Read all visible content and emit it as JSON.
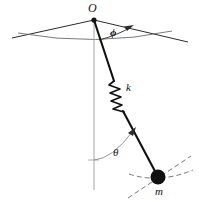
{
  "figure": {
    "type": "spherical-pendulum-with-spring-diagram",
    "background_color": "#ffffff",
    "ink_color": "#111111",
    "guide_color": "#9a9a9a",
    "labels": {
      "pivot": "O",
      "azimuth_angle": "ϕ",
      "spring_constant": "k",
      "polar_angle": "θ",
      "mass": "m"
    },
    "geometry": {
      "pivot_point": [
        94,
        20
      ],
      "mass_point": [
        158,
        177
      ],
      "vertical_axis_end": [
        94,
        190
      ],
      "ceiling_left_end": [
        12,
        38
      ],
      "ceiling_right_end": [
        188,
        42
      ],
      "spring_start": [
        113,
        82
      ],
      "spring_end": [
        124,
        110
      ],
      "spring_coils": 6,
      "mass_radius": 7,
      "phi_arc_arrow_at": [
        132,
        26
      ],
      "theta_arc_arrow_at": [
        134,
        130
      ]
    },
    "elements": [
      "pivot-point",
      "ceiling-line-left",
      "ceiling-line-right",
      "ceiling-arc",
      "phi-angle-arc",
      "vertical-reference-line",
      "pendulum-rod",
      "spring-coil",
      "theta-angle-arc",
      "point-mass",
      "mass-trajectory-dashed-arc",
      "mass-tangent-dashed-line"
    ]
  }
}
